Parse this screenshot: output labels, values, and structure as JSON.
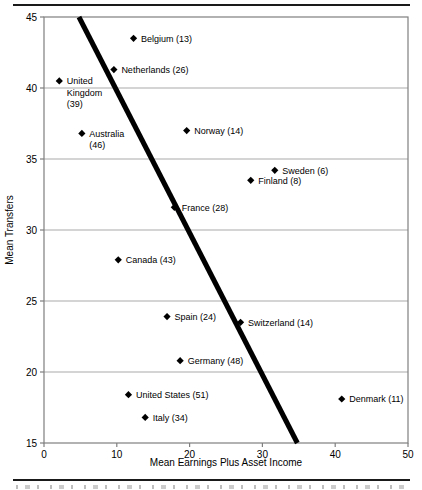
{
  "chart_data": {
    "type": "scatter",
    "title": "",
    "xlabel": "Mean Earnings Plus Asset Income",
    "ylabel": "Mean Transfers",
    "xlim": [
      0,
      50
    ],
    "ylim": [
      15,
      45
    ],
    "xticks": [
      0,
      10,
      20,
      30,
      40,
      50
    ],
    "yticks": [
      15,
      20,
      25,
      30,
      35,
      40,
      45
    ],
    "grid": "horizontal",
    "legend": "none",
    "marker": {
      "shape": "diamond",
      "color": "#000000"
    },
    "trend_line": {
      "x1": 4.8,
      "y1": 45,
      "x2": 34.8,
      "y2": 15,
      "color": "#000000"
    },
    "colors": {
      "background": "#ffffff",
      "gridline": "#a9a9a9",
      "axis": "#7f7f7f",
      "text": "#000000"
    },
    "points": [
      {
        "country": "Belgium",
        "n": 13,
        "x": 12.3,
        "y": 43.5,
        "label_lines": [
          "Belgium (13)"
        ]
      },
      {
        "country": "Netherlands",
        "n": 26,
        "x": 9.6,
        "y": 41.3,
        "label_lines": [
          "Netherlands (26)"
        ]
      },
      {
        "country": "United Kingdom",
        "n": 39,
        "x": 2.1,
        "y": 40.5,
        "label_lines": [
          "United",
          "Kingdom",
          "(39)"
        ]
      },
      {
        "country": "Australia",
        "n": 46,
        "x": 5.2,
        "y": 36.8,
        "label_lines": [
          "Australia",
          "(46)"
        ]
      },
      {
        "country": "Norway",
        "n": 14,
        "x": 19.6,
        "y": 37.0,
        "label_lines": [
          "Norway (14)"
        ]
      },
      {
        "country": "Sweden",
        "n": 6,
        "x": 31.7,
        "y": 34.2,
        "label_lines": [
          "Sweden (6)"
        ]
      },
      {
        "country": "Finland",
        "n": 8,
        "x": 28.4,
        "y": 33.5,
        "label_lines": [
          "Finland (8)"
        ]
      },
      {
        "country": "France",
        "n": 28,
        "x": 17.9,
        "y": 31.6,
        "label_lines": [
          "France (28)"
        ]
      },
      {
        "country": "Canada",
        "n": 43,
        "x": 10.2,
        "y": 27.9,
        "label_lines": [
          "Canada (43)"
        ]
      },
      {
        "country": "Spain",
        "n": 24,
        "x": 16.9,
        "y": 23.9,
        "label_lines": [
          "Spain (24)"
        ]
      },
      {
        "country": "Switzerland",
        "n": 14,
        "x": 27.0,
        "y": 23.5,
        "label_lines": [
          "Switzerland (14)"
        ]
      },
      {
        "country": "Germany",
        "n": 48,
        "x": 18.7,
        "y": 20.8,
        "label_lines": [
          "Germany (48)"
        ]
      },
      {
        "country": "United States",
        "n": 51,
        "x": 11.6,
        "y": 18.4,
        "label_lines": [
          "United States (51)"
        ]
      },
      {
        "country": "Italy",
        "n": 34,
        "x": 13.9,
        "y": 16.8,
        "label_lines": [
          "Italy (34)"
        ]
      },
      {
        "country": "Denmark",
        "n": 11,
        "x": 40.9,
        "y": 18.1,
        "label_lines": [
          "Denmark (11)"
        ]
      }
    ]
  }
}
